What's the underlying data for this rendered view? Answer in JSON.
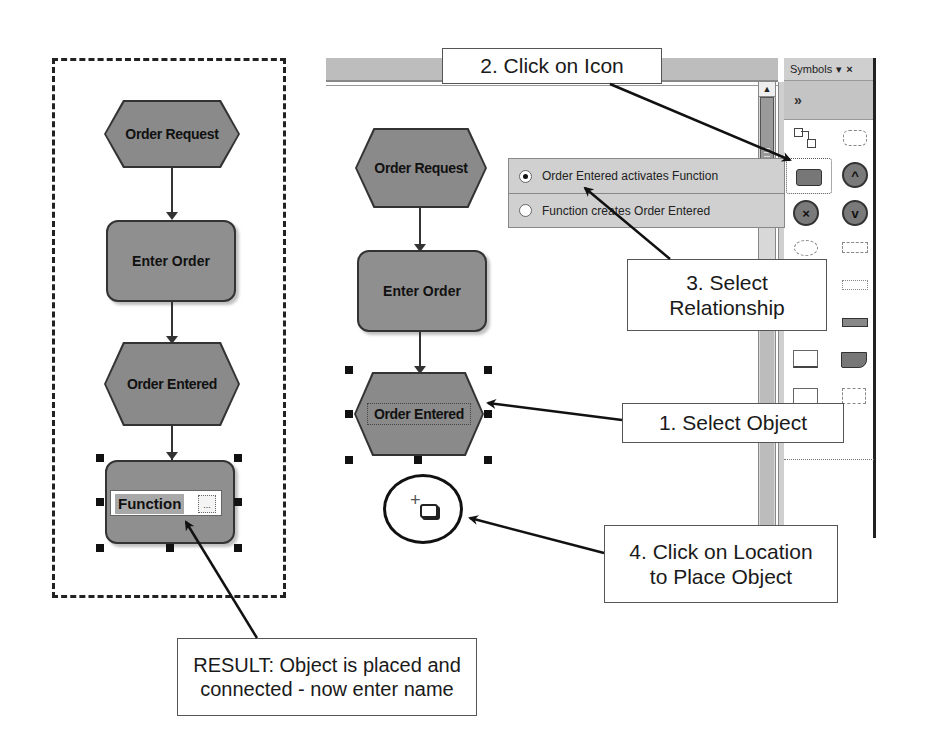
{
  "left_result": {
    "nodes": [
      {
        "type": "event",
        "label": "Order Request"
      },
      {
        "type": "function",
        "label": "Enter Order"
      },
      {
        "type": "event",
        "label": "Order Entered"
      },
      {
        "type": "function",
        "label": "Function",
        "editing": true
      }
    ],
    "edit_more_label": "..."
  },
  "canvas": {
    "nodes": [
      {
        "type": "event",
        "label": "Order Request"
      },
      {
        "type": "function",
        "label": "Enter Order"
      },
      {
        "type": "event",
        "label": "Order Entered",
        "selected": true
      }
    ],
    "scroll_up_glyph": "▲"
  },
  "symbols_panel": {
    "title": "Symbols",
    "dropdown_glyph": "▾",
    "close_glyph": "×",
    "expand_glyph": "»",
    "items": [
      {
        "name": "connection-symbol"
      },
      {
        "name": "dotted-rounded-symbol"
      },
      {
        "name": "function-symbol",
        "selected": true
      },
      {
        "name": "and-connector-symbol",
        "glyph": "^"
      },
      {
        "name": "xor-connector-symbol",
        "glyph": "×"
      },
      {
        "name": "or-connector-symbol",
        "glyph": "v"
      },
      {
        "name": "dotted-ellipse-symbol"
      },
      {
        "name": "dotted-rect-symbol"
      },
      {
        "name": "dotted-rect-2-symbol"
      },
      {
        "name": "information-carrier-symbol"
      },
      {
        "name": "system-symbol"
      },
      {
        "name": "document-symbol"
      },
      {
        "name": "square-symbol"
      },
      {
        "name": "dotted-square-symbol"
      }
    ]
  },
  "relationship_popup": {
    "options": [
      {
        "label": "Order Entered activates Function",
        "checked": true
      },
      {
        "label": "Function creates Order Entered",
        "checked": false
      }
    ]
  },
  "callouts": {
    "step1": "1. Select Object",
    "step2": "2. Click on Icon",
    "step3_line1": "3. Select",
    "step3_line2": "Relationship",
    "step4_line1": "4. Click on Location",
    "step4_line2": "to Place Object",
    "result_line1": "RESULT: Object is placed and",
    "result_line2": "connected - now enter name"
  }
}
